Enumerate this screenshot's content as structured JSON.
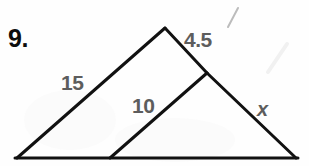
{
  "problem": {
    "number": "9."
  },
  "figure": {
    "type": "geometry-diagram",
    "stroke_color": "#111111",
    "stroke_width": 3,
    "background_color": "#fefefe",
    "label_color": "#5d5d5d",
    "number_color": "#0d0d0d",
    "vertices": {
      "apex": [
        165,
        28
      ],
      "bottom_left": [
        17,
        158
      ],
      "bottom_right": [
        296,
        158
      ],
      "right_side_midpoint": [
        207,
        73
      ],
      "base_interior_point": [
        110,
        158
      ]
    },
    "segments": [
      {
        "name": "left-hypotenuse",
        "from": [
          17,
          158
        ],
        "to": [
          165,
          28
        ]
      },
      {
        "name": "upper-right-side",
        "from": [
          165,
          28
        ],
        "to": [
          207,
          73
        ]
      },
      {
        "name": "lower-right-side",
        "from": [
          207,
          73
        ],
        "to": [
          296,
          158
        ]
      },
      {
        "name": "baseline",
        "from": [
          17,
          158
        ],
        "to": [
          296,
          158
        ]
      },
      {
        "name": "inner-hypotenuse",
        "from": [
          110,
          158
        ],
        "to": [
          207,
          73
        ]
      }
    ]
  },
  "labels": {
    "left_side": "15",
    "upper_right_side": "4.5",
    "inner_side": "10",
    "unknown_side": "x"
  },
  "artifacts": {
    "scan_marks": [
      {
        "name": "slash-mark-top-right",
        "from": [
          238,
          8
        ],
        "to": [
          228,
          26
        ],
        "color": "#b9b9b9"
      },
      {
        "name": "faint-streak-right",
        "from": [
          287,
          44
        ],
        "to": [
          268,
          72
        ],
        "color": "#f0f0f0"
      }
    ]
  }
}
